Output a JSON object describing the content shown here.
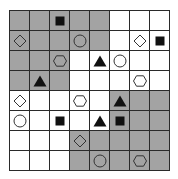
{
  "game": {
    "rows": 8,
    "cols": 8,
    "colors": {
      "gray": "#a3a3a3",
      "white": "#ffffff",
      "grid_line": "#2a2a2a",
      "piece_fill": "#111111",
      "outline": "#333333"
    },
    "legend": {
      "G": "gray cell",
      "W": "white cell",
      "square": "filled black square",
      "triangle": "filled black triangle",
      "diamond": "outline diamond",
      "circle": "outline circle",
      "hexagon": "outline hexagon"
    },
    "board": [
      [
        {
          "c": "G",
          "p": null
        },
        {
          "c": "G",
          "p": null
        },
        {
          "c": "G",
          "p": "square"
        },
        {
          "c": "G",
          "p": null
        },
        {
          "c": "G",
          "p": null
        },
        {
          "c": "W",
          "p": null
        },
        {
          "c": "W",
          "p": null
        },
        {
          "c": "W",
          "p": null
        }
      ],
      [
        {
          "c": "G",
          "p": "diamond"
        },
        {
          "c": "G",
          "p": null
        },
        {
          "c": "G",
          "p": null
        },
        {
          "c": "G",
          "p": "circle"
        },
        {
          "c": "G",
          "p": null
        },
        {
          "c": "W",
          "p": null
        },
        {
          "c": "W",
          "p": "diamond"
        },
        {
          "c": "W",
          "p": "square"
        }
      ],
      [
        {
          "c": "G",
          "p": null
        },
        {
          "c": "G",
          "p": null
        },
        {
          "c": "G",
          "p": "hexagon"
        },
        {
          "c": "W",
          "p": null
        },
        {
          "c": "W",
          "p": "triangle"
        },
        {
          "c": "W",
          "p": "circle"
        },
        {
          "c": "W",
          "p": null
        },
        {
          "c": "W",
          "p": null
        }
      ],
      [
        {
          "c": "G",
          "p": null
        },
        {
          "c": "G",
          "p": "triangle"
        },
        {
          "c": "G",
          "p": null
        },
        {
          "c": "W",
          "p": null
        },
        {
          "c": "W",
          "p": null
        },
        {
          "c": "W",
          "p": null
        },
        {
          "c": "W",
          "p": "hexagon"
        },
        {
          "c": "W",
          "p": null
        }
      ],
      [
        {
          "c": "W",
          "p": "diamond"
        },
        {
          "c": "W",
          "p": null
        },
        {
          "c": "W",
          "p": null
        },
        {
          "c": "W",
          "p": "hexagon"
        },
        {
          "c": "W",
          "p": null
        },
        {
          "c": "G",
          "p": "triangle"
        },
        {
          "c": "G",
          "p": null
        },
        {
          "c": "G",
          "p": null
        }
      ],
      [
        {
          "c": "W",
          "p": "circle"
        },
        {
          "c": "W",
          "p": null
        },
        {
          "c": "W",
          "p": "square"
        },
        {
          "c": "W",
          "p": null
        },
        {
          "c": "W",
          "p": "triangle"
        },
        {
          "c": "G",
          "p": "square"
        },
        {
          "c": "G",
          "p": null
        },
        {
          "c": "G",
          "p": null
        }
      ],
      [
        {
          "c": "W",
          "p": null
        },
        {
          "c": "W",
          "p": null
        },
        {
          "c": "W",
          "p": null
        },
        {
          "c": "G",
          "p": "diamond"
        },
        {
          "c": "G",
          "p": null
        },
        {
          "c": "G",
          "p": null
        },
        {
          "c": "G",
          "p": null
        },
        {
          "c": "G",
          "p": null
        }
      ],
      [
        {
          "c": "W",
          "p": null
        },
        {
          "c": "W",
          "p": null
        },
        {
          "c": "W",
          "p": null
        },
        {
          "c": "G",
          "p": null
        },
        {
          "c": "G",
          "p": "circle"
        },
        {
          "c": "G",
          "p": null
        },
        {
          "c": "G",
          "p": "hexagon"
        },
        {
          "c": "G",
          "p": null
        }
      ]
    ]
  }
}
